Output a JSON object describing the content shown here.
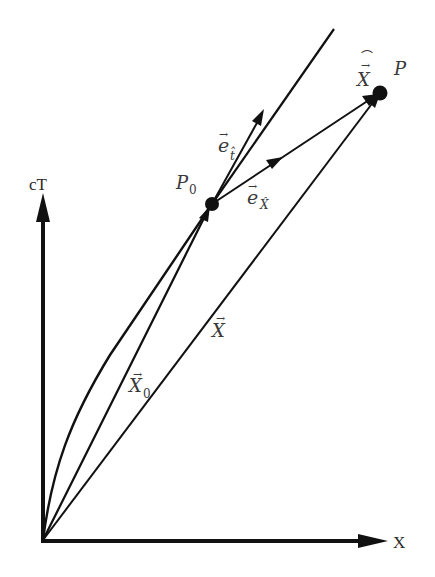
{
  "diagram": {
    "axes": {
      "vertical_label": "cT",
      "horizontal_label": "X"
    },
    "points": {
      "p0": {
        "label": "P",
        "subscript": "0"
      },
      "p": {
        "label": "P"
      }
    },
    "vectors": {
      "x0": {
        "label": "X",
        "subscript": "0",
        "accent": "→"
      },
      "x": {
        "label": "X",
        "accent": "→"
      },
      "x_hat": {
        "label": "X",
        "accent": "→",
        "hat": "⌒"
      },
      "e_t": {
        "label": "e",
        "accent": "→",
        "subscript": "t̂"
      },
      "e_x": {
        "label": "e",
        "accent": "→",
        "subscript": "X̂"
      }
    },
    "colors": {
      "ink": "#111111",
      "label": "#3a3a3a",
      "background": "#ffffff"
    }
  }
}
